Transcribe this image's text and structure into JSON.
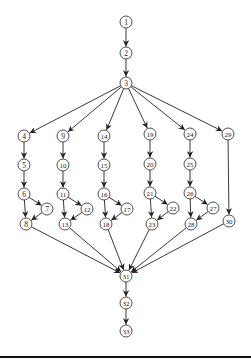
{
  "diagram": {
    "type": "directed-acyclic-graph",
    "node_radius": 6,
    "colors": {
      "stroke": "#222222",
      "fill": "#ffffff",
      "text": "#222222",
      "background": "#ffffff"
    },
    "nodes": [
      {
        "id": "1",
        "x": 126,
        "y": 22
      },
      {
        "id": "2",
        "x": 126,
        "y": 53
      },
      {
        "id": "3",
        "x": 126,
        "y": 83
      },
      {
        "id": "4",
        "x": 24,
        "y": 136
      },
      {
        "id": "5",
        "x": 24,
        "y": 165
      },
      {
        "id": "6",
        "x": 24,
        "y": 194
      },
      {
        "id": "7",
        "x": 47,
        "y": 209
      },
      {
        "id": "8",
        "x": 26,
        "y": 224
      },
      {
        "id": "9",
        "x": 63,
        "y": 136
      },
      {
        "id": "10",
        "x": 63,
        "y": 165
      },
      {
        "id": "11",
        "x": 63,
        "y": 194
      },
      {
        "id": "12",
        "x": 87,
        "y": 209
      },
      {
        "id": "13",
        "x": 65,
        "y": 224
      },
      {
        "id": "14",
        "x": 104,
        "y": 136
      },
      {
        "id": "15",
        "x": 104,
        "y": 165
      },
      {
        "id": "16",
        "x": 104,
        "y": 194
      },
      {
        "id": "17",
        "x": 127,
        "y": 209
      },
      {
        "id": "18",
        "x": 106,
        "y": 224
      },
      {
        "id": "19",
        "x": 150,
        "y": 134
      },
      {
        "id": "20",
        "x": 150,
        "y": 164
      },
      {
        "id": "21",
        "x": 150,
        "y": 193
      },
      {
        "id": "22",
        "x": 173,
        "y": 208
      },
      {
        "id": "23",
        "x": 152,
        "y": 224
      },
      {
        "id": "24",
        "x": 190,
        "y": 134
      },
      {
        "id": "25",
        "x": 190,
        "y": 164
      },
      {
        "id": "26",
        "x": 190,
        "y": 193
      },
      {
        "id": "27",
        "x": 213,
        "y": 208
      },
      {
        "id": "28",
        "x": 191,
        "y": 224
      },
      {
        "id": "29",
        "x": 228,
        "y": 134
      },
      {
        "id": "30",
        "x": 229,
        "y": 221
      },
      {
        "id": "31",
        "x": 126,
        "y": 276
      },
      {
        "id": "32",
        "x": 126,
        "y": 303
      },
      {
        "id": "33",
        "x": 126,
        "y": 331
      }
    ],
    "edges": [
      [
        "1",
        "2"
      ],
      [
        "2",
        "3"
      ],
      [
        "3",
        "4"
      ],
      [
        "3",
        "9"
      ],
      [
        "3",
        "14"
      ],
      [
        "3",
        "19"
      ],
      [
        "3",
        "24"
      ],
      [
        "3",
        "29"
      ],
      [
        "4",
        "5"
      ],
      [
        "5",
        "6"
      ],
      [
        "6",
        "7"
      ],
      [
        "6",
        "8"
      ],
      [
        "7",
        "8"
      ],
      [
        "9",
        "10"
      ],
      [
        "10",
        "11"
      ],
      [
        "11",
        "12"
      ],
      [
        "11",
        "13"
      ],
      [
        "12",
        "13"
      ],
      [
        "14",
        "15"
      ],
      [
        "15",
        "16"
      ],
      [
        "16",
        "17"
      ],
      [
        "16",
        "18"
      ],
      [
        "17",
        "18"
      ],
      [
        "19",
        "20"
      ],
      [
        "20",
        "21"
      ],
      [
        "21",
        "22"
      ],
      [
        "21",
        "23"
      ],
      [
        "22",
        "23"
      ],
      [
        "24",
        "25"
      ],
      [
        "25",
        "26"
      ],
      [
        "26",
        "27"
      ],
      [
        "26",
        "28"
      ],
      [
        "27",
        "28"
      ],
      [
        "29",
        "30"
      ],
      [
        "8",
        "31"
      ],
      [
        "13",
        "31"
      ],
      [
        "18",
        "31"
      ],
      [
        "23",
        "31"
      ],
      [
        "28",
        "31"
      ],
      [
        "30",
        "31"
      ],
      [
        "31",
        "32"
      ],
      [
        "32",
        "33"
      ]
    ]
  }
}
